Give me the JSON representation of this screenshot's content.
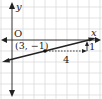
{
  "diagram": {
    "type": "coordinate-plane-line",
    "axes": {
      "x_label": "x",
      "y_label": "y",
      "origin_label": "O"
    },
    "point": {
      "label": "(3, −1)",
      "x": 3,
      "y": -1
    },
    "run": {
      "label": "4",
      "value": 4
    },
    "rise": {
      "label": "1",
      "value": 1
    },
    "colors": {
      "grid": "#d9d9d9",
      "axis": "#222222",
      "line": "#222222"
    }
  }
}
